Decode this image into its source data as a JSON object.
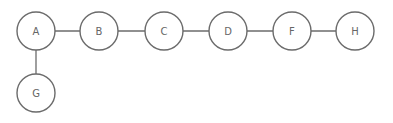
{
  "diagram": {
    "type": "graph",
    "nodes": [
      {
        "id": "A",
        "label": "A",
        "x": 36,
        "y": 31
      },
      {
        "id": "B",
        "label": "B",
        "x": 99,
        "y": 31
      },
      {
        "id": "C",
        "label": "C",
        "x": 164,
        "y": 31
      },
      {
        "id": "D",
        "label": "D",
        "x": 228,
        "y": 31
      },
      {
        "id": "F",
        "label": "F",
        "x": 292,
        "y": 31
      },
      {
        "id": "H",
        "label": "H",
        "x": 355,
        "y": 31
      },
      {
        "id": "G",
        "label": "G",
        "x": 36,
        "y": 93
      }
    ],
    "edges": [
      {
        "from": "A",
        "to": "B"
      },
      {
        "from": "B",
        "to": "C"
      },
      {
        "from": "C",
        "to": "D"
      },
      {
        "from": "D",
        "to": "F"
      },
      {
        "from": "F",
        "to": "H"
      },
      {
        "from": "A",
        "to": "G"
      }
    ],
    "node_radius": 19,
    "colors": {
      "stroke": "#6b6b6b",
      "text": "#666666",
      "fill": "#ffffff"
    }
  }
}
